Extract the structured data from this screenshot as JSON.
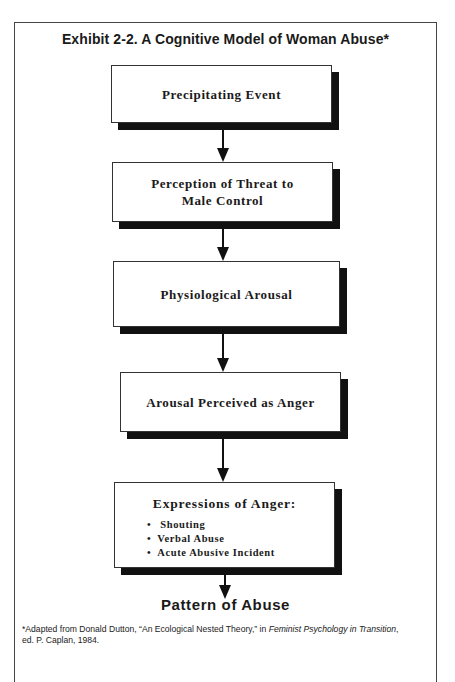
{
  "exhibit": {
    "title": "Exhibit 2-2.  A Cognitive Model of Woman Abuse*"
  },
  "flow": {
    "steps": [
      {
        "label": "Precipitating Event"
      },
      {
        "label_line1": "Perception of Threat to",
        "label_line2": "Male Control"
      },
      {
        "label": "Physiological Arousal"
      },
      {
        "label": "Arousal Perceived as Anger"
      },
      {
        "label": "Expressions of Anger:",
        "items": [
          "Shouting",
          "Verbal Abuse",
          "Acute Abusive Incident"
        ]
      }
    ],
    "outcome": "Pattern of Abuse"
  },
  "footnote": {
    "prefix": "*Adapted from Donald Dutton, “An Ecological Nested Theory,” in ",
    "book_title": "Feminist Psychology in Transition",
    "suffix": ",",
    "line2": "ed. P. Caplan, 1984."
  },
  "colors": {
    "ink": "#111111",
    "border": "#333333",
    "background": "#ffffff"
  }
}
